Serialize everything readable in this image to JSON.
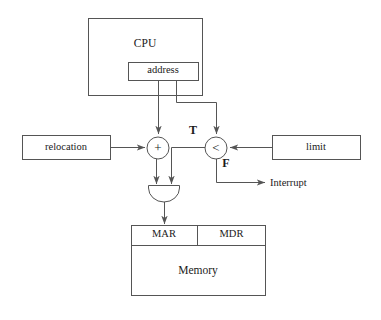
{
  "diagram": {
    "stroke_color": "#555555",
    "text_color": "#1a1a1a",
    "background": "#ffffff",
    "nodes": {
      "cpu": {
        "label": "CPU",
        "x": 88,
        "y": 18,
        "w": 114,
        "h": 77
      },
      "address": {
        "label": "address",
        "x": 128,
        "y": 62,
        "w": 70,
        "h": 18
      },
      "relocation": {
        "label": "relocation",
        "x": 22,
        "y": 135,
        "w": 88,
        "h": 24
      },
      "limit": {
        "label": "limit",
        "x": 272,
        "y": 135,
        "w": 88,
        "h": 24
      },
      "adder": {
        "label": "+",
        "cx": 158,
        "cy": 148,
        "r": 11
      },
      "comparator": {
        "label": "<",
        "cx": 216,
        "cy": 148,
        "r": 11
      },
      "and_gate": {
        "label": "",
        "x": 148,
        "y": 185,
        "w": 32,
        "h": 16
      },
      "mar": {
        "label": "MAR",
        "x": 131,
        "y": 225,
        "w": 66,
        "h": 20
      },
      "mdr": {
        "label": "MDR",
        "x": 197,
        "y": 225,
        "w": 68,
        "h": 20
      },
      "memory": {
        "label": "Memory",
        "x": 131,
        "y": 245,
        "w": 134,
        "h": 50
      }
    },
    "edge_labels": {
      "true_branch": "T",
      "false_branch": "F",
      "interrupt": "Interrupt"
    },
    "edges": [
      {
        "from": "address",
        "to": "adder",
        "label": ""
      },
      {
        "from": "address",
        "to": "comparator",
        "label": ""
      },
      {
        "from": "relocation",
        "to": "adder",
        "label": ""
      },
      {
        "from": "limit",
        "to": "comparator",
        "label": ""
      },
      {
        "from": "adder",
        "to": "and_gate",
        "label": ""
      },
      {
        "from": "comparator",
        "to": "and_gate",
        "label": "T"
      },
      {
        "from": "comparator",
        "to": "interrupt",
        "label": "F"
      },
      {
        "from": "and_gate",
        "to": "mar",
        "label": ""
      }
    ]
  }
}
